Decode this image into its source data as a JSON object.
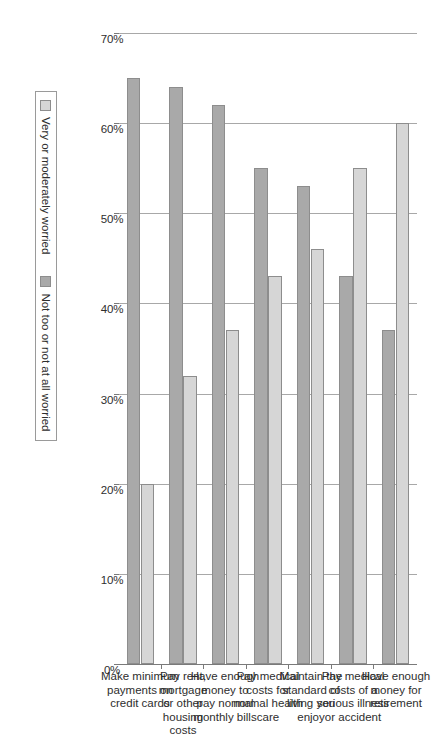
{
  "chart_data": {
    "type": "bar",
    "orientation": "vertical-grouped-rendered-rotated",
    "title": "",
    "xlabel": "",
    "ylabel": "",
    "ylim": [
      0,
      70
    ],
    "grid": true,
    "legend_position": "bottom",
    "tick_labels": [
      "70%",
      "60%",
      "50%",
      "40%",
      "30%",
      "20%",
      "10%",
      "0%"
    ],
    "tick_values": [
      70,
      60,
      50,
      40,
      30,
      20,
      10,
      0
    ],
    "categories": [
      "Have enough\nmoney for\nretirement",
      "Pay medical\ncosts of a\nserious illness\nor accident",
      "Maintain the\nstandard of\nliving you\nenjoy",
      "Pay medical\ncosts for\nnormal health\ncare",
      "Have enough\nmoney to\npay normal\nmonthly bills",
      "Pay rent,\nmortgage\nor other housing\ncosts",
      "Make minimum\npayments on\ncredit cards"
    ],
    "series": [
      {
        "name": "Very or moderately worried",
        "color": "#d6d6d6",
        "values": [
          60,
          55,
          46,
          43,
          37,
          32,
          20
        ]
      },
      {
        "name": "Not too or not at all worried",
        "color": "#a9a9a9",
        "values": [
          37,
          43,
          53,
          55,
          62,
          64,
          65
        ]
      }
    ]
  },
  "legend": {
    "entries": [
      {
        "label": "Very or moderately worried",
        "swatch": "light"
      },
      {
        "label": "Not too or not at all worried",
        "swatch": "dark"
      }
    ]
  },
  "colors": {
    "series_light": "#d6d6d6",
    "series_dark": "#a9a9a9",
    "gridline": "#a8a8a8",
    "axis": "#7a7a7a",
    "text": "#2e2e2e"
  }
}
